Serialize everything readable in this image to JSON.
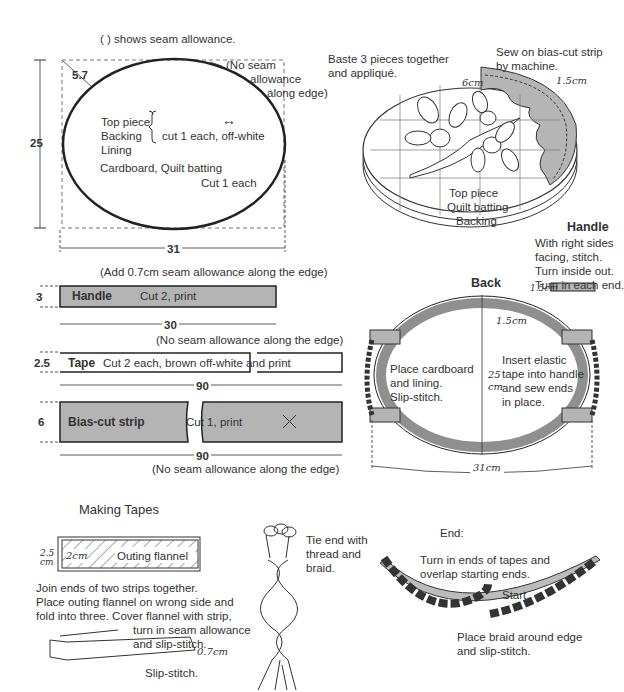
{
  "legend": {
    "seam_note": "(        ) shows seam allowance."
  },
  "pattern": {
    "dim_corner": "5.7",
    "dim_height": "25",
    "dim_width": "31",
    "no_seam_1": "(No seam",
    "no_seam_2": "allowance",
    "no_seam_3": "along edge)",
    "pieces": [
      "Top piece",
      "Backing",
      "Lining"
    ],
    "pieces_cut": "cut 1 each, off-white",
    "grain_arrow": "↔",
    "other_pieces": "Cardboard, Quilt batting",
    "other_cut": "Cut 1 each"
  },
  "assembly": {
    "baste_note_1": "Baste 3 pieces together",
    "baste_note_2": "and appliqué.",
    "sew_note_1": "Sew on bias-cut strip",
    "sew_note_2": "by machine.",
    "dim_6cm": "6cm",
    "dim_15cm": "1.5cm",
    "layers": [
      "Top piece",
      "Quilt batting",
      "Backing"
    ]
  },
  "strips": {
    "handle_note": "(Add 0.7cm seam allowance along the edge)",
    "handle_label": "Handle",
    "handle_cut": "Cut 2, print",
    "handle_h": "3",
    "handle_w": "30",
    "tape_note": "(No seam allowance along the edge)",
    "tape_label": "Tape",
    "tape_cut": "Cut 2 each, brown off-white and print",
    "tape_h": "2.5",
    "tape_w": "90",
    "bias_label": "Bias-cut strip",
    "bias_cut": "Cut 1, print",
    "bias_h": "6",
    "bias_w": "90",
    "bias_note": "(No seam allowance along the edge)"
  },
  "handle_instr": {
    "title": "Handle",
    "lines": [
      "With right sides",
      "facing, stitch.",
      "Turn inside out.",
      "Turn in each end."
    ],
    "dim": "1.5cm"
  },
  "back": {
    "title": "Back",
    "dim_15": "1.5cm",
    "height_1": "25",
    "height_2": "cm",
    "width": "31cm",
    "left_note": [
      "Place cardboard",
      "and lining.",
      "Slip-stitch."
    ],
    "right_note": [
      "Insert elastic",
      "tape into handle",
      "and sew ends",
      "in place."
    ]
  },
  "tapes": {
    "title": "Making Tapes",
    "dim_25a": "2.5",
    "dim_25b": "cm",
    "dim_2": "2cm",
    "flannel": "Outing flannel",
    "instr": [
      "Join ends of two strips together.",
      "Place outing flannel on wrong side and",
      "fold into three. Cover flannel with strip,"
    ],
    "turn_note": [
      "turn in seam allowance",
      "and slip-stitch."
    ],
    "dim_07": "0.7cm",
    "slip_note": "Slip-stitch.",
    "tie_note": [
      "Tie end with",
      "thread and",
      "braid."
    ]
  },
  "end": {
    "title": "End:",
    "turn_note": [
      "Turn in ends of tapes and",
      "overlap starting ends."
    ],
    "start": "Start",
    "place_note": [
      "Place braid around edge",
      "and slip-stitch."
    ]
  }
}
